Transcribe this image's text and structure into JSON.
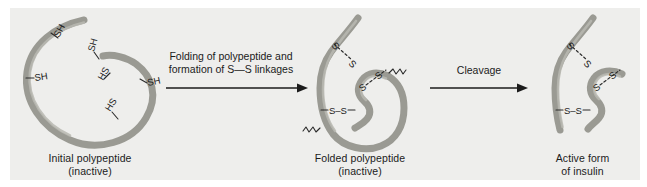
{
  "figure": {
    "background_color": "#eeeeec",
    "page_color": "#ffffff",
    "chain_color": "#9a9a93",
    "text_color": "#1b1b1b"
  },
  "stages": [
    {
      "id": "initial",
      "caption_line1": "Initial polypeptide",
      "caption_line2": "(inactive)",
      "caption": "Initial polypeptide\n(inactive)",
      "thiol_labels": [
        "SH",
        "SH",
        "SH",
        "HS",
        "SH",
        "HS"
      ],
      "thiol_count": 6,
      "disulfide_count": 0
    },
    {
      "id": "folded",
      "caption_line1": "Folded polypeptide",
      "caption_line2": "(inactive)",
      "caption": "Folded polypeptide\n(inactive)",
      "disulfide_labels": [
        "S—S",
        "S—S",
        "S—S"
      ],
      "disulfide_count": 3,
      "cleavage_marker_count": 2
    },
    {
      "id": "insulin",
      "caption_line1": "Active form",
      "caption_line2": "of insulin",
      "caption": "Active form\nof insulin",
      "disulfide_labels": [
        "S—S",
        "S—S",
        "S—S"
      ],
      "disulfide_count": 3,
      "chain_count": 2
    }
  ],
  "arrows": [
    {
      "id": "arrow-folding",
      "label_line1": "Folding of polypeptide and",
      "label_line2": "formation of S—S linkages",
      "label": "Folding of polypeptide and\nformation of S—S linkages"
    },
    {
      "id": "arrow-cleavage",
      "label_line1": "Cleavage",
      "label_line2": "",
      "label": "Cleavage"
    }
  ],
  "atom_labels": {
    "sulfhydryl": "SH",
    "sulfhydryl_reversed": "HS",
    "disulfide": "S",
    "sulfur": "S"
  }
}
